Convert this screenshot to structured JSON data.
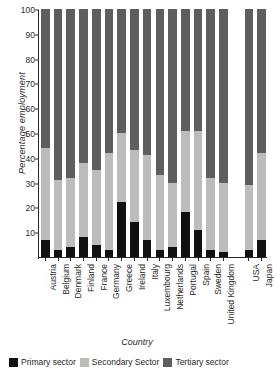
{
  "chart_data": {
    "type": "bar",
    "subtype": "stacked-bar-100",
    "title": "",
    "xlabel": "Country",
    "ylabel": "Percentage employment",
    "ylim": [
      0,
      100
    ],
    "yticks": [
      10,
      20,
      30,
      40,
      50,
      60,
      70,
      80,
      90,
      100
    ],
    "grid": false,
    "legend_position": "bottom",
    "categories": [
      "Austria",
      "Belgium",
      "Denmark",
      "Finland",
      "France",
      "Germany",
      "Greece",
      "Ireland",
      "Italy",
      "Luxembourg",
      "Netherlands",
      "Portugal",
      "Spain",
      "Sweden",
      "United Kingdom",
      "USA",
      "Japan"
    ],
    "gap_after_category": "United Kingdom",
    "series": [
      {
        "name": "Primary sector",
        "color": "#111111",
        "values": [
          7,
          3,
          4,
          8,
          5,
          3,
          22,
          14,
          7,
          3,
          4,
          18,
          11,
          3,
          2,
          3,
          7
        ]
      },
      {
        "name": "Secondary Sector",
        "color": "#bcbcbc",
        "values": [
          37,
          28,
          28,
          30,
          30,
          39,
          28,
          29,
          34,
          30,
          26,
          33,
          40,
          29,
          28,
          26,
          35
        ]
      },
      {
        "name": "Tertiary sector",
        "color": "#5e5e5e",
        "values": [
          56,
          69,
          68,
          62,
          65,
          58,
          50,
          57,
          59,
          67,
          70,
          49,
          49,
          68,
          70,
          71,
          58
        ]
      }
    ],
    "stack_tops": {
      "primary": [
        7,
        3,
        4,
        8,
        5,
        3,
        22,
        14,
        7,
        3,
        4,
        18,
        11,
        3,
        2,
        3,
        7
      ],
      "secondary_cumulative": [
        44,
        31,
        32,
        38,
        35,
        42,
        50,
        43,
        41,
        33,
        30,
        51,
        51,
        32,
        30,
        29,
        42
      ]
    }
  },
  "legend": {
    "items": [
      {
        "label": "Primary sector",
        "swatch": "primary-swatch"
      },
      {
        "label": "Secondary Sector",
        "swatch": "secondary-swatch"
      },
      {
        "label": "Tertiary sector",
        "swatch": "tertiary-swatch"
      }
    ]
  }
}
